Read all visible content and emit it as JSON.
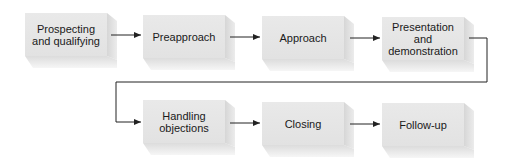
{
  "diagram": {
    "type": "flowchart",
    "title": "",
    "steps": [
      {
        "id": 1,
        "label": "Prospecting and qualifying",
        "lines": [
          "Prospecting",
          "and qualifying"
        ]
      },
      {
        "id": 2,
        "label": "Preapproach",
        "lines": [
          "Preapproach"
        ]
      },
      {
        "id": 3,
        "label": "Approach",
        "lines": [
          "Approach"
        ]
      },
      {
        "id": 4,
        "label": "Presentation and demonstration",
        "lines": [
          "Presentation",
          "and",
          "demonstration"
        ]
      },
      {
        "id": 5,
        "label": "Handling objections",
        "lines": [
          "Handling",
          "objections"
        ]
      },
      {
        "id": 6,
        "label": "Closing",
        "lines": [
          "Closing"
        ]
      },
      {
        "id": 7,
        "label": "Follow-up",
        "lines": [
          "Follow-up"
        ]
      }
    ],
    "edges": [
      {
        "from": 1,
        "to": 2
      },
      {
        "from": 2,
        "to": 3
      },
      {
        "from": 3,
        "to": 4
      },
      {
        "from": 4,
        "to": 5
      },
      {
        "from": 5,
        "to": 6
      },
      {
        "from": 6,
        "to": 7
      }
    ],
    "colors": {
      "box_face": "#e6e6e6",
      "box_side": "#d6d6d6",
      "line": "#222222",
      "text": "#1a1a1a"
    }
  },
  "labels": {
    "s1": "Prospecting\nand qualifying",
    "s2": "Preapproach",
    "s3": "Approach",
    "s4": "Presentation\nand\ndemonstration",
    "s5": "Handling\nobjections",
    "s6": "Closing",
    "s7": "Follow-up"
  }
}
